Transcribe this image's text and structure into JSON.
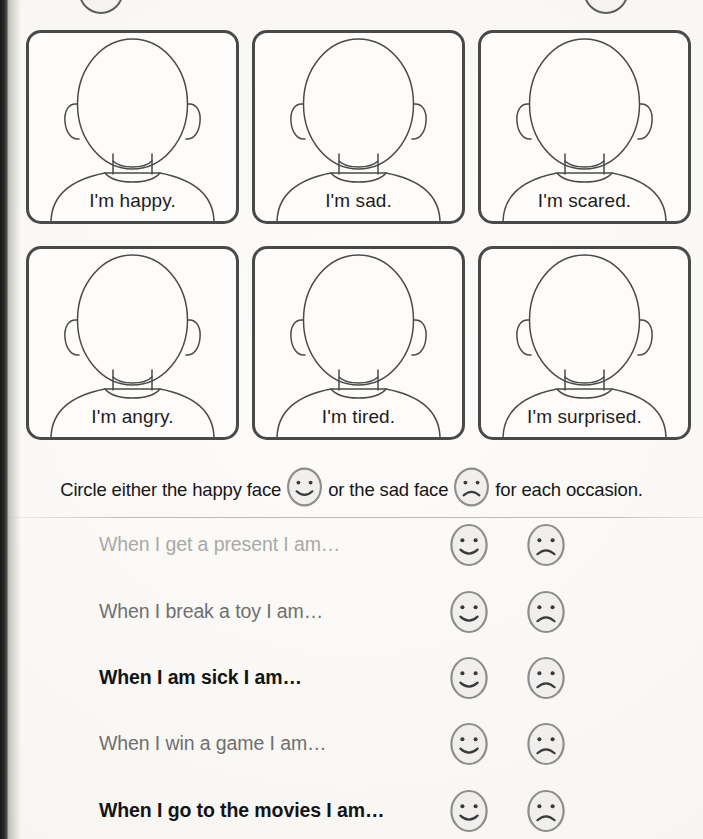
{
  "page": {
    "type": "worksheet",
    "background_color": "#fbfaf8",
    "ink_color": "#1d1d1d"
  },
  "emotion_cards": {
    "rows": [
      [
        {
          "label": "I'm happy.",
          "emotion": "happy"
        },
        {
          "label": "I'm sad.",
          "emotion": "sad"
        },
        {
          "label": "I'm scared.",
          "emotion": "scared"
        }
      ],
      [
        {
          "label": "I'm angry.",
          "emotion": "angry"
        },
        {
          "label": "I'm tired.",
          "emotion": "tired"
        },
        {
          "label": "I'm surprised.",
          "emotion": "surprised"
        }
      ]
    ]
  },
  "instruction": {
    "part1": "Circle either the happy face",
    "part2": "or the sad face",
    "part3": "for each occasion.",
    "happy_icon": "happy-face-icon",
    "sad_icon": "sad-face-icon"
  },
  "questions": [
    {
      "text_before": "When ",
      "cap": "I",
      "text_after": " get a present I am…",
      "full": "When I get a present I am…",
      "tone": "tone-light"
    },
    {
      "text_before": "When ",
      "cap": "I",
      "text_after": " break a toy I am…",
      "full": "When I break a toy I am…",
      "tone": "tone-mid"
    },
    {
      "text_before": "When ",
      "cap": "I",
      "text_after": " am sick I am…",
      "full": "When I am sick I am…",
      "tone": "tone-dark"
    },
    {
      "text_before": "When ",
      "cap": "I",
      "text_after": " win a game I am…",
      "full": "When I win a game I am…",
      "tone": "tone-mid"
    },
    {
      "text_before": "When ",
      "cap": "I",
      "text_after": " go to the movies I am…",
      "full": "When I go to the movies I am…",
      "tone": "tone-dark"
    }
  ],
  "answer_options": {
    "happy_label": "happy-face-option",
    "sad_label": "sad-face-option"
  },
  "colors": {
    "card_border": "#494949",
    "face_outline": "#4a4a4a",
    "icon_fill": "#f0efed",
    "icon_stroke": "#8d8d8d",
    "icon_feature": "#3a3a3a",
    "text_light": "#a9a9a9",
    "text_mid": "#6f6f6f",
    "text_dark": "#141414"
  }
}
